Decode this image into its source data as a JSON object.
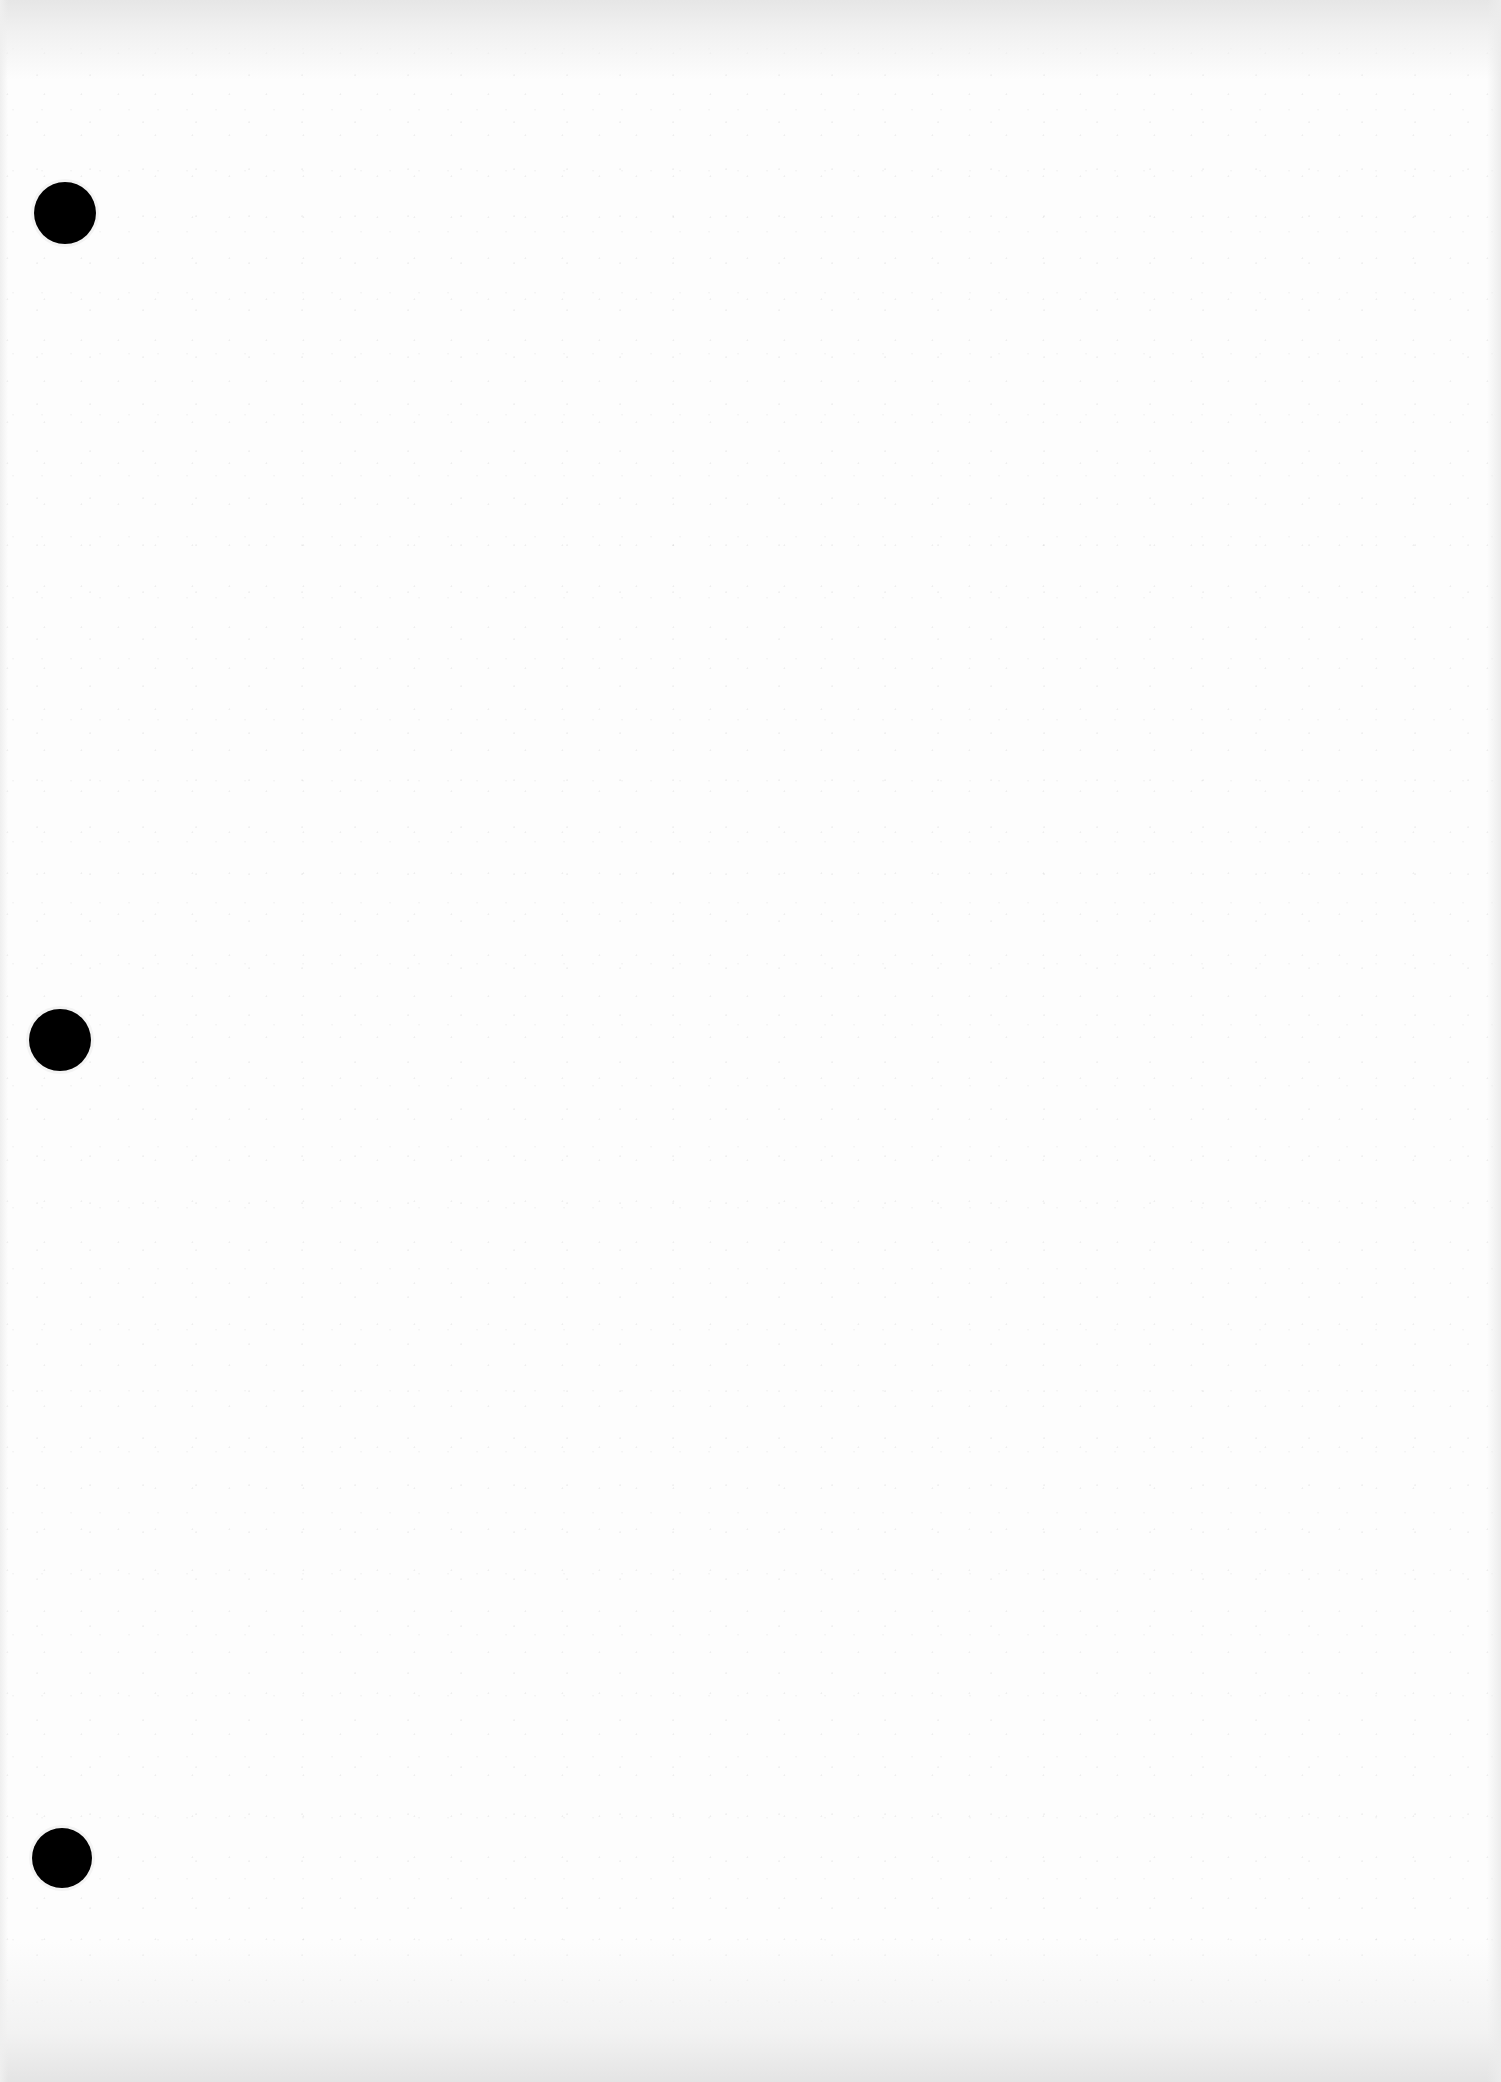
{
  "page": {
    "type": "blank scanned sheet",
    "background_color": "#fdfdfd",
    "text_content": ""
  },
  "punch_holes": [
    {
      "position": "top",
      "cx": 65,
      "cy": 213,
      "diameter": 62,
      "color": "#000000"
    },
    {
      "position": "middle",
      "cx": 60,
      "cy": 1040,
      "diameter": 62,
      "color": "#000000"
    },
    {
      "position": "bottom",
      "cx": 62,
      "cy": 1858,
      "diameter": 60,
      "color": "#000000"
    }
  ]
}
